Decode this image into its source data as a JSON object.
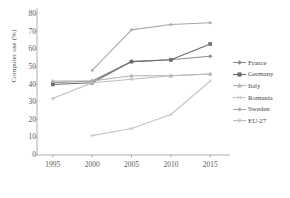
{
  "chart_data": {
    "type": "line",
    "title": "",
    "xlabel": "",
    "ylabel": "Computer use (%)",
    "x": [
      1995,
      2000,
      2005,
      2010,
      2015
    ],
    "xticklabels": [
      "1995",
      "2000",
      "2005",
      "2010",
      "2015"
    ],
    "yticklabels": [
      "0",
      "10",
      "20",
      "30",
      "40",
      "50",
      "60",
      "70",
      "80"
    ],
    "yticks": [
      0,
      10,
      20,
      30,
      40,
      50,
      60,
      70,
      80
    ],
    "ylim": [
      0,
      80
    ],
    "xlim": [
      1993,
      2017
    ],
    "grid": false,
    "legend_position": "right",
    "series": [
      {
        "name": "France",
        "values": [
          41,
          42,
          53,
          54,
          56
        ],
        "color": "#8c8c8c",
        "marker": "diamond"
      },
      {
        "name": "Germany",
        "values": [
          40,
          41,
          53,
          54,
          63
        ],
        "color": "#6b6b6b",
        "marker": "square"
      },
      {
        "name": "Italy",
        "values": [
          42,
          42,
          45,
          45,
          46
        ],
        "color": "#b0b0b0",
        "marker": "triangle"
      },
      {
        "name": "Romania",
        "values": [
          null,
          11,
          15,
          23,
          42
        ],
        "color": "#c4c4c4",
        "marker": "cross"
      },
      {
        "name": "Sweden",
        "values": [
          null,
          48,
          71,
          74,
          75
        ],
        "color": "#a8a8a8",
        "marker": "asterisk"
      },
      {
        "name": "EU-27",
        "values": [
          32,
          41,
          43,
          45,
          46
        ],
        "color": "#bdbdbd",
        "marker": "circle"
      }
    ]
  },
  "legend": {
    "items": [
      {
        "label": "France"
      },
      {
        "label": "Germany"
      },
      {
        "label": "Italy"
      },
      {
        "label": "Romania"
      },
      {
        "label": "Sweden"
      },
      {
        "label": "EU-27"
      }
    ]
  },
  "axes": {
    "y_title": "Computer use (%)"
  }
}
